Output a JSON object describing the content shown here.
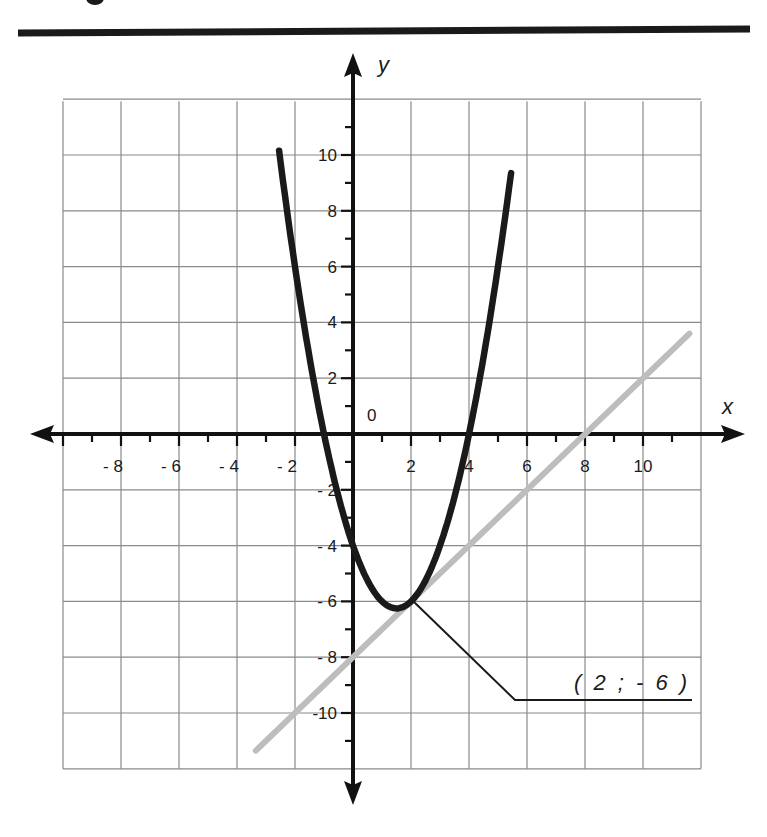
{
  "header": {
    "rule_color": "#1a1a1a"
  },
  "chart_data": {
    "type": "line",
    "title": "",
    "xlabel": "x",
    "ylabel": "y",
    "origin_label": "0",
    "xlim": [
      -10,
      12
    ],
    "ylim": [
      -12,
      12
    ],
    "grid": true,
    "x_tick_labels": [
      "- 8",
      "- 6",
      "- 4",
      "- 2",
      "2",
      "4",
      "6",
      "8",
      "10"
    ],
    "x_tick_values": [
      -8,
      -6,
      -4,
      -2,
      2,
      4,
      6,
      8,
      10
    ],
    "y_tick_labels": [
      "10",
      "8",
      "6",
      "4",
      "2",
      "- 2",
      "- 4",
      "- 6",
      "- 8",
      "-10"
    ],
    "y_tick_values": [
      10,
      8,
      6,
      4,
      2,
      -2,
      -4,
      -6,
      -8,
      -10
    ],
    "series": [
      {
        "name": "parabola",
        "equation": "y = x² - 3x - 4",
        "color": "#1a1a1a",
        "x_range": [
          -2.55,
          5.45
        ],
        "points": [
          [
            -2.5,
            9.75
          ],
          [
            -2,
            6
          ],
          [
            -1,
            0
          ],
          [
            0,
            -4
          ],
          [
            1,
            -6
          ],
          [
            1.5,
            -6.25
          ],
          [
            2,
            -6
          ],
          [
            3,
            -4
          ],
          [
            4,
            0
          ],
          [
            5,
            6
          ],
          [
            5.45,
            9.35
          ]
        ]
      },
      {
        "name": "tangent line",
        "equation": "y = x - 8",
        "color": "#bdbdbd",
        "x_range": [
          -3.35,
          11.6
        ],
        "points": [
          [
            -3.35,
            -11.35
          ],
          [
            0,
            -8
          ],
          [
            2,
            -6
          ],
          [
            8,
            0
          ],
          [
            11.6,
            3.6
          ]
        ]
      }
    ],
    "annotations": [
      {
        "text": "( 2 ; - 6 )",
        "point": [
          2,
          -6
        ]
      }
    ]
  }
}
